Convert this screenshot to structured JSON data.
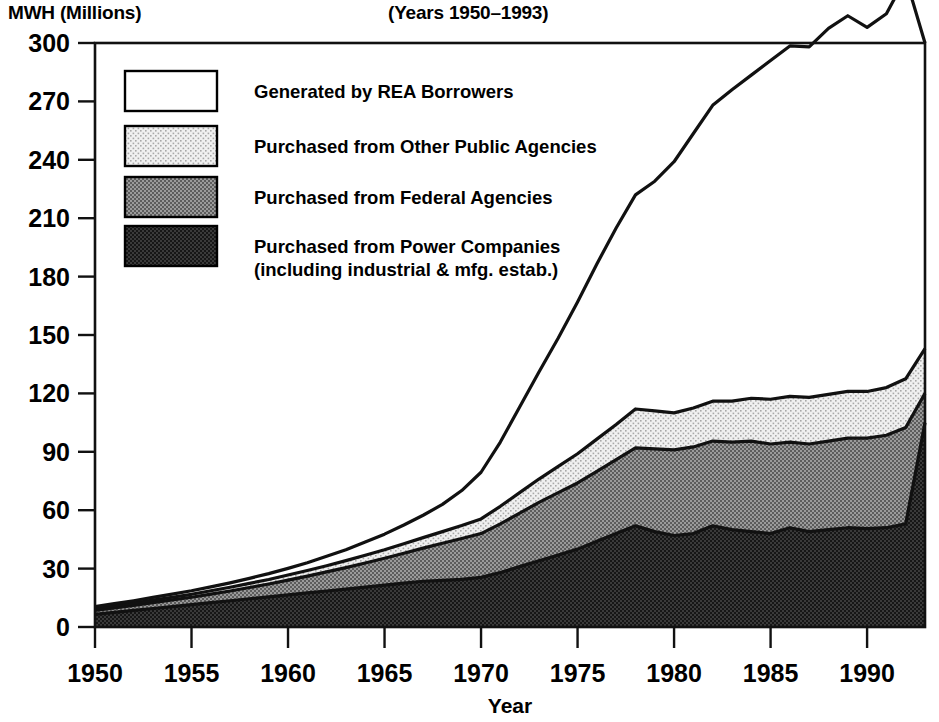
{
  "header": {
    "y_axis_title": "MWH (Millions)",
    "chart_title": "(Years 1950–1993)"
  },
  "axes": {
    "x_label": "Year",
    "y_ticks": [
      "0",
      "30",
      "60",
      "90",
      "120",
      "150",
      "180",
      "210",
      "240",
      "270",
      "300"
    ],
    "x_ticks": [
      "1950",
      "1955",
      "1960",
      "1965",
      "1970",
      "1975",
      "1980",
      "1985",
      "1990"
    ]
  },
  "legend": {
    "items": [
      {
        "label": "Generated by REA Borrowers",
        "label2": "",
        "swatch": "white",
        "color": "#ffffff"
      },
      {
        "label": "Purchased from Other Public Agencies",
        "label2": "",
        "swatch": "light-stipple",
        "color": "#e2e2e2"
      },
      {
        "label": "Purchased from Federal Agencies",
        "label2": "",
        "swatch": "mid-hatch",
        "color": "#8a8a8a"
      },
      {
        "label": "Purchased from Power Companies",
        "label2": "(including industrial & mfg. estab.)",
        "swatch": "dark-fill",
        "color": "#2b2b2b"
      }
    ]
  },
  "chart_data": {
    "type": "area",
    "stacked": true,
    "title": "(Years 1950–1993)",
    "xlabel": "Year",
    "ylabel": "MWH (Millions)",
    "xlim": [
      1950,
      1993
    ],
    "ylim": [
      0,
      300
    ],
    "grid": false,
    "legend_position": "inside-top-left",
    "x": [
      1950,
      1951,
      1952,
      1953,
      1954,
      1955,
      1956,
      1957,
      1958,
      1959,
      1960,
      1961,
      1962,
      1963,
      1964,
      1965,
      1966,
      1967,
      1968,
      1969,
      1970,
      1971,
      1972,
      1973,
      1974,
      1975,
      1976,
      1977,
      1978,
      1979,
      1980,
      1981,
      1982,
      1983,
      1984,
      1985,
      1986,
      1987,
      1988,
      1989,
      1990,
      1991,
      1992,
      1993
    ],
    "series": [
      {
        "name": "Purchased from Power Companies (including industrial & mfg. estab.)",
        "color": "#2b2b2b",
        "values": [
          6.5,
          7.5,
          8.5,
          9.5,
          10.5,
          11.5,
          12.5,
          13.5,
          14.5,
          15.5,
          16.5,
          17.5,
          18.5,
          19.5,
          20.5,
          21.5,
          22.5,
          23.5,
          24.0,
          24.5,
          25.5,
          28.0,
          31.0,
          34.0,
          37.0,
          40.0,
          44.0,
          48.0,
          52.0,
          49.0,
          47.0,
          48.0,
          52.0,
          50.0,
          49.0,
          48.0,
          51.0,
          49.0,
          50.0,
          51.0,
          50.5,
          51.0,
          53.0,
          105.0
        ]
      },
      {
        "name": "Purchased from Federal Agencies",
        "color": "#8a8a8a",
        "values": [
          2.0,
          2.3,
          2.6,
          3.0,
          3.4,
          3.8,
          4.4,
          5.0,
          5.8,
          6.6,
          7.6,
          8.6,
          9.8,
          11.0,
          12.4,
          13.8,
          15.4,
          17.0,
          19.0,
          21.0,
          22.5,
          25.0,
          27.5,
          30.0,
          32.0,
          34.0,
          36.0,
          38.0,
          40.0,
          42.5,
          44.0,
          44.5,
          43.5,
          45.0,
          46.5,
          46.0,
          44.0,
          45.0,
          45.5,
          46.0,
          46.5,
          47.5,
          49.5,
          15.0
        ]
      },
      {
        "name": "Purchased from Other Public Agencies",
        "color": "#e2e2e2",
        "values": [
          1.0,
          1.1,
          1.2,
          1.3,
          1.4,
          1.5,
          1.7,
          1.9,
          2.1,
          2.3,
          2.6,
          2.9,
          3.2,
          3.6,
          4.0,
          4.4,
          4.9,
          5.4,
          6.0,
          6.6,
          7.5,
          9.0,
          10.5,
          12.0,
          13.5,
          15.0,
          16.5,
          18.0,
          20.0,
          19.5,
          19.0,
          20.0,
          20.5,
          21.0,
          22.0,
          23.0,
          23.5,
          24.0,
          24.0,
          24.0,
          24.0,
          24.5,
          25.0,
          23.0
        ]
      },
      {
        "name": "Generated by REA Borrowers",
        "color": "#ffffff",
        "values": [
          1.0,
          1.1,
          1.2,
          1.4,
          1.6,
          1.8,
          2.0,
          2.3,
          2.6,
          3.0,
          3.4,
          4.0,
          4.8,
          5.6,
          6.8,
          8.0,
          9.6,
          11.5,
          14.0,
          18.0,
          24.0,
          33.0,
          44.0,
          55.0,
          66.0,
          78.0,
          90.0,
          101.0,
          110.0,
          118.0,
          129.0,
          141.0,
          152.0,
          160.0,
          166.0,
          174.0,
          180.0,
          180.0,
          188.0,
          193.0,
          187.0,
          192.0,
          206.0,
          157.0
        ]
      }
    ],
    "totals": [
      10.5,
      12.0,
      13.5,
      15.2,
      16.9,
      18.6,
      20.6,
      22.7,
      25.0,
      27.4,
      30.1,
      33.0,
      36.3,
      39.7,
      43.7,
      47.7,
      52.4,
      57.4,
      63.0,
      70.1,
      79.5,
      95.0,
      113.0,
      131.0,
      148.5,
      167.0,
      186.5,
      205.0,
      222.0,
      229.0,
      239.0,
      253.5,
      268.0,
      276.0,
      283.5,
      291.0,
      298.5,
      298.0,
      307.5,
      314.0,
      308.0,
      315.0,
      333.5,
      300.0
    ]
  }
}
